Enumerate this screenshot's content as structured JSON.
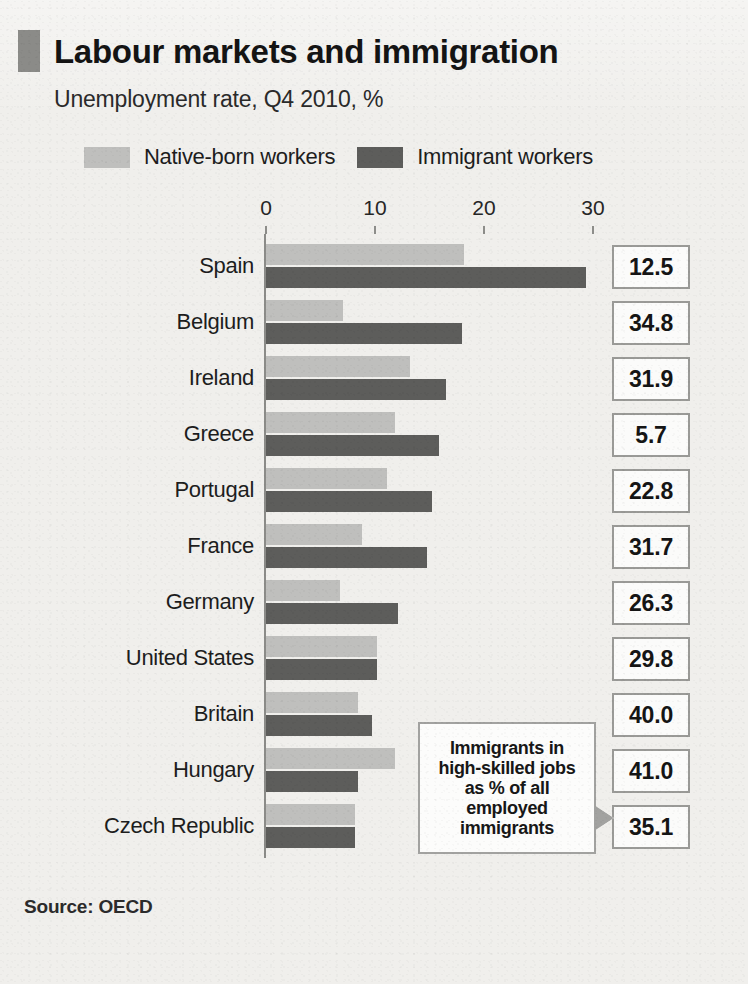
{
  "header": {
    "title": "Labour markets and immigration",
    "subtitle": "Unemployment rate, Q4 2010, %",
    "marker_color": "#8b8b88"
  },
  "legend": {
    "items": [
      {
        "label": "Native-born workers",
        "color": "#bfbfbd"
      },
      {
        "label": "Immigrant workers",
        "color": "#5d5d5b"
      }
    ]
  },
  "callout": {
    "line1": "Immigrants in",
    "line2": "high-skilled jobs",
    "line3": "as % of all",
    "line4": "employed",
    "line5": "immigrants",
    "text": "Immigrants in high-skilled jobs as % of all employed immigrants"
  },
  "source": {
    "label": "Source: OECD"
  },
  "chart_data": {
    "type": "bar",
    "orientation": "horizontal",
    "title": "Labour markets and immigration",
    "subtitle": "Unemployment rate, Q4 2010, %",
    "xlabel": "",
    "ylabel": "",
    "xlim": [
      0,
      33
    ],
    "ticks": [
      0,
      10,
      20,
      30
    ],
    "tick_labels": [
      "0",
      "10",
      "20",
      "30"
    ],
    "grid": false,
    "legend_position": "top",
    "categories": [
      "Spain",
      "Belgium",
      "Ireland",
      "Greece",
      "Portugal",
      "France",
      "Germany",
      "United States",
      "Britain",
      "Hungary",
      "Czech Republic"
    ],
    "series": [
      {
        "name": "Native-born workers",
        "color": "#bfbfbd",
        "values": [
          18.2,
          7.1,
          13.2,
          11.8,
          11.1,
          8.8,
          6.8,
          10.2,
          8.4,
          11.8,
          8.2
        ]
      },
      {
        "name": "Immigrant workers",
        "color": "#5d5d5b",
        "values": [
          29.4,
          18.0,
          16.5,
          15.9,
          15.2,
          14.8,
          12.1,
          10.2,
          9.7,
          8.4,
          8.2
        ]
      }
    ],
    "annotation_column": {
      "label": "Immigrants in high-skilled jobs as % of all employed immigrants",
      "values": [
        "12.5",
        "34.8",
        "31.9",
        "5.7",
        "22.8",
        "31.7",
        "26.3",
        "29.8",
        "40.0",
        "41.0",
        "35.1"
      ]
    }
  }
}
